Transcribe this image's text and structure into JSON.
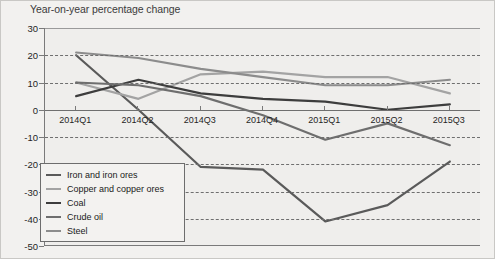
{
  "chart_data": {
    "type": "line",
    "title": "Year-on-year percentage change",
    "xlabel": "",
    "ylabel": "",
    "categories": [
      "2014Q1",
      "2014Q2",
      "2014Q3",
      "2014Q4",
      "2015Q1",
      "2015Q2",
      "2015Q3"
    ],
    "ylim": [
      -50,
      30
    ],
    "ytick_values": [
      30,
      20,
      10,
      0,
      -10,
      -20,
      -30,
      -40,
      -50
    ],
    "ytick_labels": [
      "30",
      "20",
      "10",
      "0",
      "-10",
      "-20",
      "-30",
      "-40",
      "-50"
    ],
    "grid": true,
    "grid_axis": "y",
    "legend_position": "lower-left-inside",
    "series": [
      {
        "name": "Iron and iron ores",
        "color": "#5a5a5a",
        "values": [
          20,
          0,
          -21,
          -22,
          -41,
          -35,
          -19
        ]
      },
      {
        "name": "Copper and copper ores",
        "color": "#a3a3a3",
        "values": [
          10,
          4,
          13,
          14,
          12,
          12,
          6
        ]
      },
      {
        "name": "Coal",
        "color": "#3d3d3d",
        "values": [
          5,
          11,
          6,
          4,
          3,
          0,
          2
        ]
      },
      {
        "name": "Crude oil",
        "color": "#6e6e6e",
        "values": [
          10,
          9,
          5,
          -2,
          -11,
          -5,
          -13
        ]
      },
      {
        "name": "Steel",
        "color": "#8c8c8c",
        "values": [
          21,
          19,
          15,
          12,
          9,
          9,
          11
        ]
      }
    ]
  },
  "colors": {
    "plot_background": "#efeeec",
    "figure_background": "#f2f1ef",
    "axis": "#7a7a7a",
    "grid": "#6f6f6f",
    "text": "#1f1f1f",
    "title_text": "#3b3b3b"
  }
}
